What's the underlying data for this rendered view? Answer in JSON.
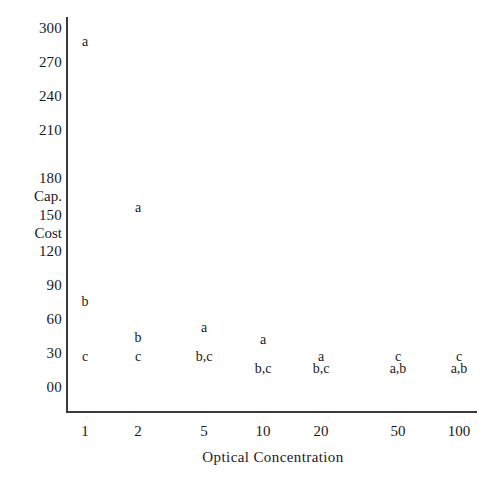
{
  "chart_data": {
    "type": "scatter",
    "title": "",
    "xlabel": "Optical Concentration",
    "ylabel": "Cap. Cost",
    "ylabel_words": [
      "Cap.",
      "Cost"
    ],
    "grid": false,
    "legend": "none",
    "x_categories": [
      "1",
      "2",
      "5",
      "10",
      "20",
      "50",
      "100"
    ],
    "y_ticks": [
      "300",
      "270",
      "240",
      "210",
      "180",
      "150",
      "120",
      "90",
      "60",
      "30",
      "00"
    ],
    "y_tick_values": [
      300,
      270,
      240,
      210,
      180,
      150,
      120,
      90,
      60,
      30,
      0
    ],
    "ylim": [
      0,
      300
    ],
    "point_labels_note": "Each plotted marker is the literal text of the series name(s) drawn at its data position",
    "points": [
      {
        "marker": "a",
        "x_category": "1",
        "y": 288
      },
      {
        "marker": "b",
        "x_category": "1",
        "y": 72
      },
      {
        "marker": "c",
        "x_category": "1",
        "y": 26
      },
      {
        "marker": "a",
        "x_category": "2",
        "y": 150
      },
      {
        "marker": "b",
        "x_category": "2",
        "y": 42
      },
      {
        "marker": "c",
        "x_category": "2",
        "y": 26
      },
      {
        "marker": "a",
        "x_category": "5",
        "y": 50
      },
      {
        "marker": "b,c",
        "x_category": "5",
        "y": 26
      },
      {
        "marker": "a",
        "x_category": "10",
        "y": 40
      },
      {
        "marker": "b,c",
        "x_category": "10",
        "y": 16
      },
      {
        "marker": "a",
        "x_category": "20",
        "y": 26
      },
      {
        "marker": "b,c",
        "x_category": "20",
        "y": 16
      },
      {
        "marker": "c",
        "x_category": "50",
        "y": 26
      },
      {
        "marker": "a,b",
        "x_category": "50",
        "y": 16
      },
      {
        "marker": "c",
        "x_category": "100",
        "y": 26
      },
      {
        "marker": "a,b",
        "x_category": "100",
        "y": 16
      }
    ],
    "series": [
      {
        "name": "a",
        "categories": [
          "1",
          "2",
          "5",
          "10",
          "20",
          "50",
          "100"
        ],
        "values": [
          288,
          150,
          50,
          40,
          26,
          16,
          16
        ]
      },
      {
        "name": "b",
        "categories": [
          "1",
          "2",
          "5",
          "10",
          "20",
          "50",
          "100"
        ],
        "values": [
          72,
          42,
          26,
          16,
          16,
          16,
          16
        ]
      },
      {
        "name": "c",
        "categories": [
          "1",
          "2",
          "5",
          "10",
          "20",
          "50",
          "100"
        ],
        "values": [
          26,
          26,
          26,
          16,
          16,
          26,
          26
        ]
      }
    ],
    "colors": {
      "axis": "#3a3a3c",
      "text": "#1a1a1a",
      "background": "#ffffff"
    }
  }
}
